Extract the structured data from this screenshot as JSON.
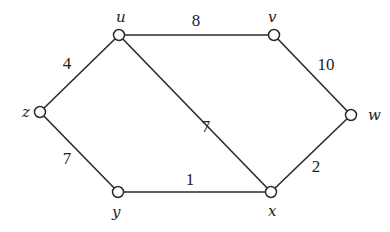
{
  "graph": {
    "type": "weighted-undirected-graph",
    "nodes": [
      {
        "id": "u",
        "label": "u"
      },
      {
        "id": "v",
        "label": "v"
      },
      {
        "id": "w",
        "label": "w"
      },
      {
        "id": "x",
        "label": "x"
      },
      {
        "id": "y",
        "label": "y"
      },
      {
        "id": "z",
        "label": "z"
      }
    ],
    "edges": [
      {
        "from": "u",
        "to": "v",
        "weight": "8"
      },
      {
        "from": "v",
        "to": "w",
        "weight": "10"
      },
      {
        "from": "z",
        "to": "u",
        "weight": "4"
      },
      {
        "from": "u",
        "to": "x",
        "weight": "7"
      },
      {
        "from": "z",
        "to": "y",
        "weight": "7"
      },
      {
        "from": "y",
        "to": "x",
        "weight": "1"
      },
      {
        "from": "x",
        "to": "w",
        "weight": "2"
      }
    ]
  }
}
